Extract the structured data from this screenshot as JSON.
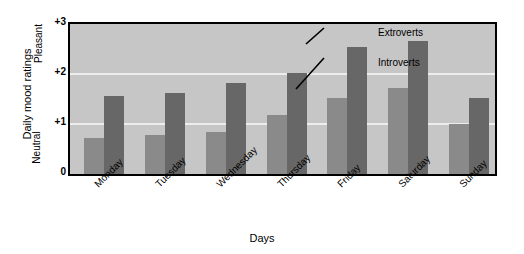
{
  "chart_data": {
    "type": "bar",
    "title": "",
    "xlabel": "Days",
    "ylabel": "Daily mood ratings",
    "y_anchor_top": "Pleasant",
    "y_anchor_bottom": "Neutral",
    "ylim": [
      0,
      3
    ],
    "yticks": [
      "0",
      "+1",
      "+2",
      "+3"
    ],
    "ytick_values": [
      0,
      1,
      2,
      3
    ],
    "gridlines": [
      1,
      2
    ],
    "grid": true,
    "legend_position": "annotations-in-plot",
    "categories": [
      "Monday",
      "Tuesday",
      "Wednesday",
      "Thursday",
      "Friday",
      "Saturday",
      "Sunday"
    ],
    "series": [
      {
        "name": "Introverts",
        "color": "#8a8a8a",
        "values": [
          0.72,
          0.78,
          0.84,
          1.18,
          1.52,
          1.72,
          1.0
        ]
      },
      {
        "name": "Extroverts",
        "color": "#676767",
        "values": [
          1.56,
          1.62,
          1.82,
          2.02,
          2.54,
          2.66,
          1.52
        ]
      }
    ],
    "annotations": [
      {
        "text": "Extroverts",
        "target_category": "Saturday",
        "target_series": "Extroverts"
      },
      {
        "text": "Introverts",
        "target_category": "Saturday",
        "target_series": "Introverts"
      }
    ],
    "plot_background": "#c6c6c6",
    "grid_color": "#ededed",
    "frame_color": "#000000"
  }
}
